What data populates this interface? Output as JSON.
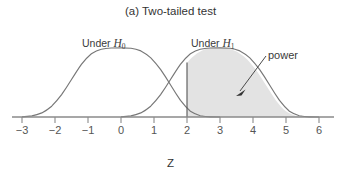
{
  "chart_data": {
    "type": "area",
    "title": "(a) Two-tailed test",
    "xlabel": "Z",
    "ylabel": "",
    "xlim": [
      -3.6,
      6.6
    ],
    "ylim": [
      0,
      0.45
    ],
    "grid": false,
    "legend_position": "inline-annotations",
    "xticks": [
      "-3",
      "-2",
      "-1",
      "0",
      "1",
      "2",
      "3",
      "4",
      "5",
      "6"
    ],
    "xtick_values": [
      -3,
      -2,
      -1,
      0,
      1,
      2,
      3,
      4,
      5,
      6
    ],
    "series": [
      {
        "name": "Under H0",
        "distribution": "normal",
        "mean": 0,
        "sd": 1,
        "peak_value": 0.399,
        "filled": false,
        "color": "#777777"
      },
      {
        "name": "Under H1",
        "distribution": "normal",
        "mean": 3,
        "sd": 1,
        "peak_value": 0.399,
        "filled": true,
        "fill_from": 2,
        "fill_to": 6.6,
        "fill_color": "#e3e3e3",
        "color": "#777777"
      }
    ],
    "critical_value": 2,
    "annotations": [
      {
        "text": "Under H",
        "subscript": "0",
        "x": -0.5,
        "role": "curve-label-h0"
      },
      {
        "text": "Under H",
        "subscript": "1",
        "x": 2.7,
        "role": "curve-label-h1"
      },
      {
        "text": "power",
        "x": 5.1,
        "role": "shaded-area-callout",
        "points_to_x": 3.5
      }
    ]
  },
  "figure": {
    "title": "(a) Two-tailed test",
    "axis_label_z": "Z",
    "label_under_h0_prefix": "Under ",
    "label_under_h0_var": "H",
    "label_under_h0_sub": "0",
    "label_under_h1_prefix": "Under ",
    "label_under_h1_var": "H",
    "label_under_h1_sub": "1",
    "label_power": "power"
  },
  "colors": {
    "curve_stroke": "#777777",
    "shade_fill": "#e3e3e3",
    "axis": "#8a8a8a",
    "text": "#3a3a3a",
    "annotation_line": "#4a4a4a"
  }
}
